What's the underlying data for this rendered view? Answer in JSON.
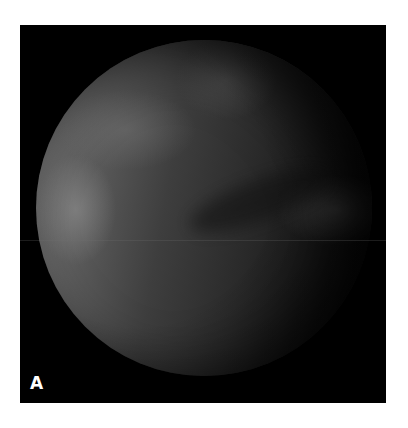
{
  "figure": {
    "panel_label": "A",
    "background_color": "#000000",
    "page_background": "#ffffff"
  }
}
